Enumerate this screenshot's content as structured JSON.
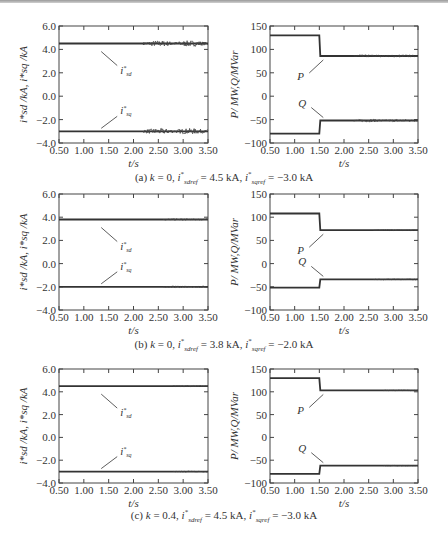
{
  "figure": {
    "panels": [
      {
        "id": "a",
        "caption": {
          "prefix": "(a) ",
          "k": "k",
          "k_val": " = 0, ",
          "i1": "i",
          "i1_sub": "sdref",
          "i1_val": " = 4.5 kA, ",
          "i2": "i",
          "i2_sub": "sqref",
          "i2_val": " = −3.0 kA"
        },
        "noise_from": 2.2,
        "noise_amp_left": 0.25,
        "noise_amp_right": 3
      },
      {
        "id": "b",
        "caption": {
          "prefix": "(b) ",
          "k": "k",
          "k_val": " = 0, ",
          "i1": "i",
          "i1_sub": "sdref",
          "i1_val": " = 3.8 kA, ",
          "i2": "i",
          "i2_sub": "sqref",
          "i2_val": " = −2.0 kA"
        },
        "noise_from": 2.6,
        "noise_amp_left": 0.08,
        "noise_amp_right": 1
      },
      {
        "id": "c",
        "caption": {
          "prefix": "(c) ",
          "k": "k",
          "k_val": " = 0.4, ",
          "i1": "i",
          "i1_sub": "sdref",
          "i1_val": " = 4.5 kA, ",
          "i2": "i",
          "i2_sub": "sqref",
          "i2_val": " = −3.0 kA"
        },
        "noise_from": 2.8,
        "noise_amp_left": 0.05,
        "noise_amp_right": 0.8
      }
    ]
  },
  "chart_data": [
    {
      "panel": "a-left",
      "type": "line",
      "xlabel": "t/s",
      "ylabel": "i*sd /kA, i*sq /kA",
      "xlim": [
        0.5,
        3.5
      ],
      "ylim": [
        -4.0,
        6.0
      ],
      "xticks": [
        "0.50",
        "1.00",
        "1.50",
        "2.00",
        "2.50",
        "3.00",
        "3.50"
      ],
      "yticks": [
        "6.0",
        "4.0",
        "2.0",
        "0.0",
        "−2.0",
        "−4.0"
      ],
      "series": [
        {
          "name": "i*sd",
          "x": [
            0.5,
            3.5
          ],
          "values": [
            4.5,
            4.5
          ],
          "note": "oscillation appears after ~2.2 s"
        },
        {
          "name": "i*sq",
          "x": [
            0.5,
            3.5
          ],
          "values": [
            -3.0,
            -3.0
          ],
          "note": "oscillation appears after ~2.2 s"
        }
      ],
      "annotations": [
        "i*sd",
        "i*sq"
      ]
    },
    {
      "panel": "a-right",
      "type": "line",
      "xlabel": "t/s",
      "ylabel": "P/ MW,Q/MVar",
      "xlim": [
        0.5,
        3.5
      ],
      "ylim": [
        -100,
        150
      ],
      "xticks": [
        "0.50",
        "1.00",
        "1.50",
        "2.00",
        "2.50",
        "3.00",
        "3.50"
      ],
      "yticks": [
        "150",
        "100",
        "50",
        "0",
        "−50",
        "−100"
      ],
      "series": [
        {
          "name": "P",
          "x": [
            0.5,
            1.5,
            1.52,
            3.5
          ],
          "values": [
            130,
            130,
            86,
            86
          ]
        },
        {
          "name": "Q",
          "x": [
            0.5,
            1.5,
            1.52,
            3.5
          ],
          "values": [
            -80,
            -80,
            -52,
            -52
          ]
        }
      ],
      "annotations": [
        "P",
        "Q"
      ]
    },
    {
      "panel": "b-left",
      "type": "line",
      "xlabel": "t/s",
      "ylabel": "i*sd /kA, i*sq /kA",
      "xlim": [
        0.5,
        3.5
      ],
      "ylim": [
        -4.0,
        6.0
      ],
      "xticks": [
        "0.50",
        "1.00",
        "1.50",
        "2.00",
        "2.50",
        "3.00",
        "3.50"
      ],
      "yticks": [
        "6.0",
        "4.0",
        "2.0",
        "0.0",
        "−2.0",
        "−4.0"
      ],
      "series": [
        {
          "name": "i*sd",
          "x": [
            0.5,
            3.5
          ],
          "values": [
            3.8,
            3.8
          ]
        },
        {
          "name": "i*sq",
          "x": [
            0.5,
            3.5
          ],
          "values": [
            -2.0,
            -2.0
          ]
        }
      ],
      "annotations": [
        "i*sd",
        "i*sq"
      ]
    },
    {
      "panel": "b-right",
      "type": "line",
      "xlabel": "t/s",
      "ylabel": "P/ MW,Q/MVar",
      "xlim": [
        0.5,
        3.5
      ],
      "ylim": [
        -100,
        150
      ],
      "xticks": [
        "0.50",
        "1.00",
        "1.50",
        "2.00",
        "2.50",
        "3.00",
        "3.50"
      ],
      "yticks": [
        "150",
        "100",
        "50",
        "0",
        "−50",
        "−100"
      ],
      "series": [
        {
          "name": "P",
          "x": [
            0.5,
            1.5,
            1.52,
            3.5
          ],
          "values": [
            108,
            108,
            72,
            72
          ]
        },
        {
          "name": "Q",
          "x": [
            0.5,
            1.5,
            1.52,
            3.5
          ],
          "values": [
            -52,
            -52,
            -34,
            -34
          ]
        }
      ],
      "annotations": [
        "P",
        "Q"
      ]
    },
    {
      "panel": "c-left",
      "type": "line",
      "xlabel": "t/s",
      "ylabel": "i*sd /kA, i*sq /kA",
      "xlim": [
        0.5,
        3.5
      ],
      "ylim": [
        -4.0,
        6.0
      ],
      "xticks": [
        "0.50",
        "1.00",
        "1.50",
        "2.00",
        "2.50",
        "3.00",
        "3.50"
      ],
      "yticks": [
        "6.0",
        "4.0",
        "2.0",
        "0.0",
        "−2.0",
        "−4.0"
      ],
      "series": [
        {
          "name": "i*sd",
          "x": [
            0.5,
            3.5
          ],
          "values": [
            4.5,
            4.5
          ]
        },
        {
          "name": "i*sq",
          "x": [
            0.5,
            3.5
          ],
          "values": [
            -3.0,
            -3.0
          ]
        }
      ],
      "annotations": [
        "i*sd",
        "i*sq"
      ]
    },
    {
      "panel": "c-right",
      "type": "line",
      "xlabel": "t/s",
      "ylabel": "P/ MW,Q/MVar",
      "xlim": [
        0.5,
        3.5
      ],
      "ylim": [
        -100,
        150
      ],
      "xticks": [
        "0.50",
        "1.00",
        "1.50",
        "2.00",
        "2.50",
        "3.00",
        "3.50"
      ],
      "yticks": [
        "150",
        "100",
        "50",
        "0",
        "−50",
        "−100"
      ],
      "series": [
        {
          "name": "P",
          "x": [
            0.5,
            1.5,
            1.52,
            3.5
          ],
          "values": [
            130,
            130,
            103,
            103
          ]
        },
        {
          "name": "Q",
          "x": [
            0.5,
            1.5,
            1.52,
            3.5
          ],
          "values": [
            -80,
            -80,
            -62,
            -62
          ]
        }
      ],
      "annotations": [
        "P",
        "Q"
      ]
    }
  ]
}
